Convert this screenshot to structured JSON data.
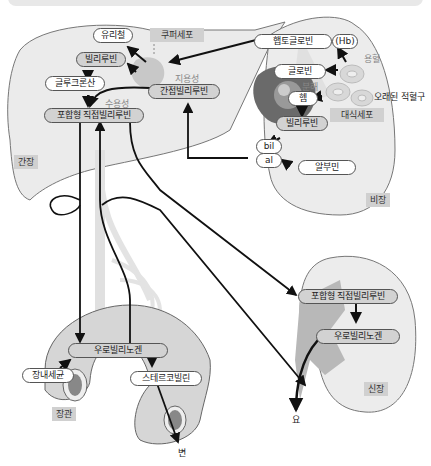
{
  "header": {
    "title": "빌리루빈 대사"
  },
  "organs": {
    "liver": "간장",
    "spleen": "비장",
    "intestine": "장관",
    "kidney": "신장"
  },
  "cells": {
    "kupffer": "쿠퍼세포",
    "macrophage": "대식세포",
    "old_rbc": "오래된 적혈구"
  },
  "liver_nodes": {
    "urea_iron": "유리철",
    "bilirubin": "빌리루빈",
    "glucuronic": "글루크론산",
    "indirect": "간접빌리루빈",
    "direct": "포합형 직접빌리루빈",
    "fat_soluble": "지용성",
    "water_soluble": "수용성"
  },
  "spleen_nodes": {
    "haptoglobin": "햅토글로빈",
    "hb": "(Hb)",
    "hemolysis": "용혈",
    "globin": "글로빈",
    "decompose": "분해",
    "heme": "헴",
    "bilirubin": "빌리루빈",
    "bil": "bil",
    "al": "al",
    "albumin": "알부민"
  },
  "intestine_nodes": {
    "urobilinogen": "우로빌리노겐",
    "bacteria": "장내세균",
    "stercobilin": "스테르코빌린",
    "feces": "변"
  },
  "kidney_nodes": {
    "direct": "포합형 직접빌리루빈",
    "urobilinogen": "우로빌리노겐",
    "urine": "요"
  },
  "colors": {
    "organ_fill": "#ebebeb",
    "organ_stroke": "#777777",
    "pill_grey": "#d2d2d2",
    "tag_bg": "#d0d0d0",
    "arrow": "#111111"
  }
}
